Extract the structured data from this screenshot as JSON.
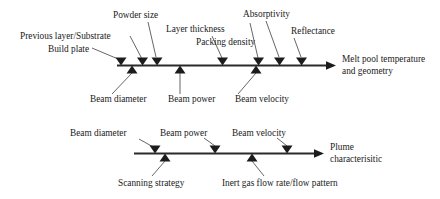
{
  "figure": {
    "type": "fishbone-ishikawa",
    "background_color": "#ffffff",
    "line_color": "#2a2a2a",
    "text_color": "#1a1a1a"
  },
  "diagrams": [
    {
      "id": "melt-pool",
      "effect": {
        "line1": "Melt pool temperature",
        "line2": "and geometry"
      },
      "causes_above": [
        {
          "label": "Previous layer/Substrate"
        },
        {
          "label": "Build plate"
        },
        {
          "label": "Powder size"
        },
        {
          "label": "Layer thickness"
        },
        {
          "label": "Packing density"
        },
        {
          "label": "Absorptivity"
        },
        {
          "label": "Reflectance"
        }
      ],
      "causes_below": [
        {
          "label": "Beam diameter"
        },
        {
          "label": "Beam power"
        },
        {
          "label": "Beam velocity"
        }
      ]
    },
    {
      "id": "plume",
      "effect": {
        "line1": "Plume",
        "line2": "characterisitic"
      },
      "causes_above": [
        {
          "label": "Beam diameter"
        },
        {
          "label": "Beam power"
        },
        {
          "label": "Beam velocity"
        }
      ],
      "causes_below": [
        {
          "label": "Scanning strategy"
        },
        {
          "label": "Inert gas flow rate/flow pattern"
        }
      ]
    }
  ]
}
